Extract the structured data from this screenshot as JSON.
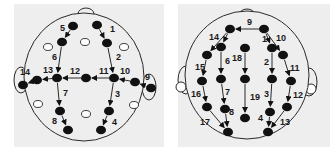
{
  "colors": {
    "panel": "#eeeeee",
    "line": "#2a2a2a",
    "node": "#111111",
    "open": "#ffffff"
  },
  "left_head": {
    "panel": {
      "x": 14,
      "y": 4,
      "w": 150,
      "h": 143
    },
    "head": {
      "cx": 84,
      "cy": 77,
      "rx": 60,
      "ry": 64
    },
    "nose": {
      "cx": 86,
      "cy": 14,
      "rx": 8,
      "ry": 6
    },
    "ears": [
      {
        "cx": 21,
        "cy": 80,
        "rx": 7,
        "ry": 13
      },
      {
        "cx": 149,
        "cy": 87,
        "rx": 7,
        "ry": 13
      }
    ],
    "nodes": [
      {
        "id": "a",
        "x": 73,
        "y": 26
      },
      {
        "id": "b",
        "x": 62,
        "y": 42
      },
      {
        "id": "c",
        "x": 97,
        "y": 25
      },
      {
        "id": "d",
        "x": 107,
        "y": 43
      },
      {
        "id": "e",
        "x": 57,
        "y": 78
      },
      {
        "id": "f",
        "x": 86,
        "y": 78
      },
      {
        "id": "g",
        "x": 114,
        "y": 78
      },
      {
        "id": "h",
        "x": 23,
        "y": 85
      },
      {
        "id": "i",
        "x": 37,
        "y": 80
      },
      {
        "id": "j",
        "x": 135,
        "y": 82
      },
      {
        "id": "k",
        "x": 151,
        "y": 88
      },
      {
        "id": "l",
        "x": 60,
        "y": 111
      },
      {
        "id": "m",
        "x": 68,
        "y": 130
      },
      {
        "id": "n",
        "x": 109,
        "y": 111
      },
      {
        "id": "o",
        "x": 101,
        "y": 130
      }
    ],
    "open_nodes": [
      {
        "x": 48,
        "y": 47
      },
      {
        "x": 85,
        "y": 42
      },
      {
        "x": 124,
        "y": 47
      },
      {
        "x": 38,
        "y": 104
      },
      {
        "x": 86,
        "y": 114
      },
      {
        "x": 134,
        "y": 105
      }
    ],
    "arrows": [
      {
        "label": "1",
        "from": "c",
        "to": "d",
        "lx": 110,
        "ly": 32
      },
      {
        "label": "2",
        "from": "d",
        "to": "g",
        "lx": 116,
        "ly": 60
      },
      {
        "label": "3",
        "from": "g",
        "to": "n",
        "lx": 115,
        "ly": 97
      },
      {
        "label": "4",
        "from": "n",
        "to": "o",
        "lx": 112,
        "ly": 125
      },
      {
        "label": "5",
        "from": "a",
        "to": "b",
        "lx": 60,
        "ly": 31
      },
      {
        "label": "6",
        "from": "b",
        "to": "e",
        "lx": 52,
        "ly": 60
      },
      {
        "label": "7",
        "from": "e",
        "to": "l",
        "lx": 63,
        "ly": 96
      },
      {
        "label": "8",
        "from": "l",
        "to": "m",
        "lx": 52,
        "ly": 124
      },
      {
        "label": "9",
        "from": "k",
        "to": "j",
        "lx": 145,
        "ly": 80
      },
      {
        "label": "10",
        "from": "j",
        "to": "g",
        "lx": 120,
        "ly": 74
      },
      {
        "label": "11",
        "from": "g",
        "to": "f",
        "lx": 99,
        "ly": 74
      },
      {
        "label": "12",
        "from": "f",
        "to": "e",
        "lx": 70,
        "ly": 74
      },
      {
        "label": "13",
        "from": "e",
        "to": "i",
        "lx": 43,
        "ly": 73
      },
      {
        "label": "14",
        "from": "i",
        "to": "h",
        "lx": 20,
        "ly": 75
      }
    ]
  },
  "right_head": {
    "panel": {
      "x": 178,
      "y": 4,
      "w": 152,
      "h": 143
    },
    "head": {
      "cx": 247,
      "cy": 75,
      "rx": 62,
      "ry": 64
    },
    "nose": {
      "cx": 247,
      "cy": 15,
      "rx": 8,
      "ry": 6
    },
    "ears": [
      {
        "cx": 186,
        "cy": 80,
        "rx": 8,
        "ry": 14
      },
      {
        "cx": 309,
        "cy": 82,
        "rx": 8,
        "ry": 14
      }
    ],
    "ear_lobes": [
      {
        "cx": 181,
        "cy": 87,
        "r": 5
      },
      {
        "cx": 311,
        "cy": 89,
        "r": 5
      }
    ],
    "nodes": [
      {
        "id": "tl",
        "x": 230,
        "y": 29
      },
      {
        "id": "tr",
        "x": 264,
        "y": 29
      },
      {
        "id": "l1",
        "x": 207,
        "y": 55
      },
      {
        "id": "l2",
        "x": 221,
        "y": 47
      },
      {
        "id": "m1",
        "x": 245,
        "y": 48
      },
      {
        "id": "r1",
        "x": 272,
        "y": 48
      },
      {
        "id": "r2",
        "x": 283,
        "y": 55
      },
      {
        "id": "a1",
        "x": 202,
        "y": 81
      },
      {
        "id": "a2",
        "x": 221,
        "y": 79
      },
      {
        "id": "a3",
        "x": 245,
        "y": 79
      },
      {
        "id": "a4",
        "x": 272,
        "y": 79
      },
      {
        "id": "a5",
        "x": 291,
        "y": 81
      },
      {
        "id": "b1",
        "x": 207,
        "y": 107
      },
      {
        "id": "b2",
        "x": 225,
        "y": 109
      },
      {
        "id": "b3",
        "x": 245,
        "y": 118
      },
      {
        "id": "b4",
        "x": 270,
        "y": 112
      },
      {
        "id": "b5",
        "x": 287,
        "y": 107
      },
      {
        "id": "c1",
        "x": 228,
        "y": 132
      },
      {
        "id": "c2",
        "x": 268,
        "y": 132
      }
    ],
    "arrows": [
      {
        "label": "1",
        "from": "tr",
        "to": "r1",
        "lx": 262,
        "ly": 42
      },
      {
        "label": "2",
        "from": "r1",
        "to": "a4",
        "lx": 264,
        "ly": 65
      },
      {
        "label": "3",
        "from": "a4",
        "to": "b4",
        "lx": 264,
        "ly": 97
      },
      {
        "label": "4",
        "from": "b4",
        "to": "c2",
        "lx": 258,
        "ly": 121
      },
      {
        "label": "6",
        "from": "l2",
        "to": "a2",
        "lx": 225,
        "ly": 64
      },
      {
        "label": "7",
        "from": "a2",
        "to": "b2",
        "lx": 225,
        "ly": 95
      },
      {
        "label": "8",
        "from": "b2",
        "to": "c1",
        "lx": 229,
        "ly": 115
      },
      {
        "label": "9",
        "from": "tr",
        "to": "tl",
        "lx": 247,
        "ly": 25
      },
      {
        "label": "10",
        "from": "tr",
        "to": "r2",
        "lx": 276,
        "ly": 41
      },
      {
        "label": "11",
        "from": "r2",
        "to": "a5",
        "lx": 290,
        "ly": 71
      },
      {
        "label": "12",
        "from": "a5",
        "to": "b5",
        "lx": 293,
        "ly": 98
      },
      {
        "label": "13",
        "from": "b5",
        "to": "c2",
        "lx": 280,
        "ly": 125
      },
      {
        "label": "14",
        "from": "tl",
        "to": "l1",
        "lx": 209,
        "ly": 40
      },
      {
        "label": "14b",
        "from": "tl",
        "to": "l2",
        "lx": null,
        "ly": null
      },
      {
        "label": "15",
        "from": "l1",
        "to": "a1",
        "lx": 195,
        "ly": 70
      },
      {
        "label": "16",
        "from": "a1",
        "to": "b1",
        "lx": 191,
        "ly": 97
      },
      {
        "label": "17",
        "from": "b1",
        "to": "c1",
        "lx": 200,
        "ly": 125
      },
      {
        "label": "18",
        "from": "m1",
        "to": "a3",
        "lx": 232,
        "ly": 61
      },
      {
        "label": "19",
        "from": "a3",
        "to": "b3",
        "lx": 250,
        "ly": 100
      }
    ]
  }
}
